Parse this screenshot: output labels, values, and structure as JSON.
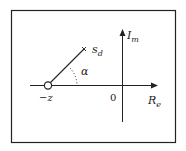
{
  "diagram": {
    "type": "s-plane pole-zero diagram",
    "axes": {
      "real_label": "R",
      "real_sub": "e",
      "imag_label": "I",
      "imag_sub": "m",
      "origin_label": "0"
    },
    "zero": {
      "label": "−z",
      "marker": "circle"
    },
    "point": {
      "label": "s",
      "sub": "d",
      "marker": "cross"
    },
    "angle": {
      "label": "α"
    },
    "colors": {
      "line": "#222222",
      "frame": "#222222",
      "background": "#ffffff"
    }
  }
}
